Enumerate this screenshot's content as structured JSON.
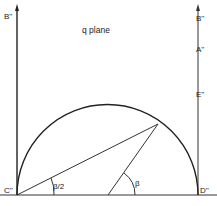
{
  "diagram": {
    "title": "q plane",
    "labels": {
      "left_top": "B''",
      "right_top": "B''",
      "right_a": "A''",
      "right_e": "E''",
      "bottom_left": "C''",
      "bottom_right": "D''",
      "angle_half": "β/2",
      "angle_full": "β"
    }
  }
}
